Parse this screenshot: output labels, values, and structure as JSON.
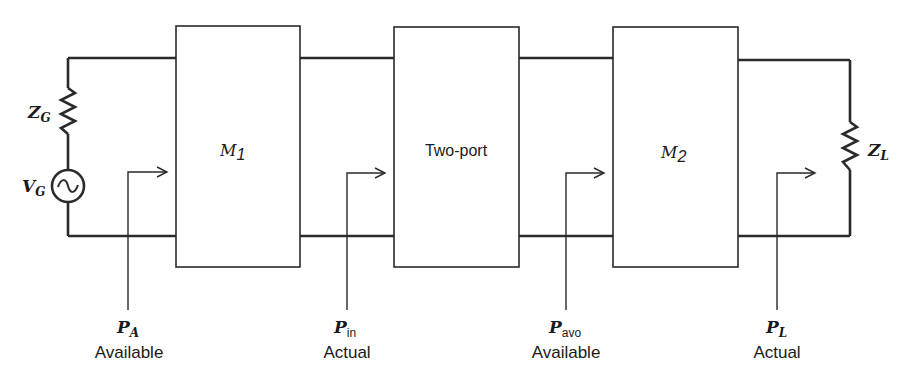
{
  "diagram": {
    "type": "cascaded two-port power flow",
    "source": {
      "impedance_label": {
        "main": "Z",
        "sub": "G"
      },
      "voltage_label": {
        "main": "V",
        "sub": "G"
      }
    },
    "load": {
      "impedance_label": {
        "main": "Z",
        "sub": "L"
      }
    },
    "blocks": [
      {
        "id": "m1",
        "label_main": "M",
        "label_sub": "1"
      },
      {
        "id": "two-port",
        "label": "Two-port"
      },
      {
        "id": "m2",
        "label_main": "M",
        "label_sub": "2"
      }
    ],
    "power_markers": [
      {
        "id": "pa",
        "symbol": "P",
        "sub": "A",
        "caption": "Available"
      },
      {
        "id": "pin",
        "symbol": "P",
        "sub": "in",
        "caption": "Actual"
      },
      {
        "id": "pavo",
        "symbol": "P",
        "sub": "avo",
        "caption": "Available"
      },
      {
        "id": "pl",
        "symbol": "P",
        "sub": "L",
        "caption": "Actual"
      }
    ],
    "colors": {
      "line": "#2a2a2a",
      "background": "#ffffff"
    }
  }
}
